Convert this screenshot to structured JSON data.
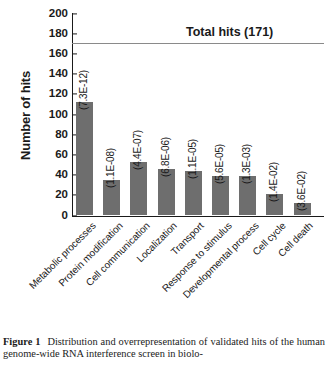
{
  "figure": {
    "caption_label": "Figure 1",
    "caption_text": "Distribution and overrepresentation of validated hits of the human genome-wide RNA interference screen in biolo-"
  },
  "axes": {
    "ylabel": "Number of hits",
    "yticks": [
      0,
      20,
      40,
      60,
      80,
      100,
      120,
      140,
      160,
      180,
      200
    ],
    "ymin": 0,
    "ymax": 200
  },
  "annotation": {
    "total_hits_label": "Total hits (171)",
    "total_hits_value": 171
  },
  "chart_data": {
    "type": "bar",
    "title": "",
    "xlabel": "",
    "ylabel": "Number of hits",
    "ylim": [
      0,
      200
    ],
    "grid": false,
    "legend": "none",
    "bar_color": "#6e6e6e",
    "categories": [
      "Metabolic processes",
      "Protein modification",
      "Cell communication",
      "Localization",
      "Transport",
      "Response to stimulus",
      "Developmental process",
      "Cell cycle",
      "Cell death"
    ],
    "values": [
      112,
      35,
      53,
      46,
      44,
      39,
      39,
      21,
      12
    ],
    "point_labels": [
      "(7.3E-12)",
      "(1.1E-08)",
      "(4.4E-07)",
      "(6.8E-06)",
      "(1.1E-05)",
      "(5.6E-05)",
      "(1.3E-03)",
      "(1.4E-02)",
      "(3.6E-02)"
    ],
    "annotations": [
      {
        "type": "hline",
        "y": 171,
        "label": "Total hits (171)"
      }
    ]
  }
}
